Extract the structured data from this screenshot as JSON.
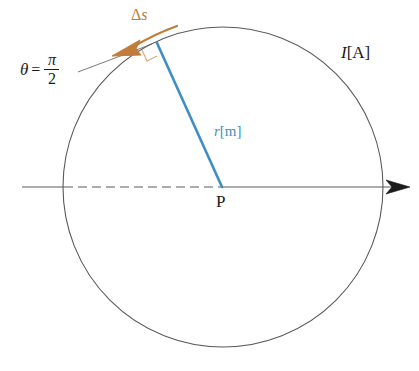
{
  "figure": {
    "width": 419,
    "height": 371,
    "background": "#ffffff"
  },
  "colors": {
    "circle_stroke": "#5a5a5a",
    "axis_stroke": "#5a5a5a",
    "radius_blue": "#3d8ec4",
    "arc_orange": "#c07c38",
    "text_black": "#1a1a1a"
  },
  "geometry": {
    "center": {
      "x": 223,
      "y": 187
    },
    "radius": 160,
    "radius_endpoint": {
      "x": 157,
      "y": 43
    },
    "axis_y": 187,
    "axis_start_x": 22,
    "axis_end_x": 408,
    "arrow_tip_x": 410
  },
  "labels": {
    "theta": {
      "symbol": "θ",
      "equals": "=",
      "numerator": "π",
      "denominator": "2",
      "full_text": "θ = π/2"
    },
    "delta_s": {
      "delta": "Δ",
      "variable": "s",
      "full_text": "Δs"
    },
    "current": {
      "variable": "I",
      "unit": "[A]",
      "full_text": "I[A]"
    },
    "radius": {
      "variable": "r",
      "unit": "[m]",
      "full_text": "r[m]"
    },
    "point_p": {
      "text": "P"
    }
  },
  "elements": {
    "circle_name": "current-loop-circle",
    "axis_name": "horizontal-axis",
    "dashed_segment_name": "dashed-axis-segment",
    "radius_line_name": "radius-line",
    "arc_arrow_name": "delta-s-arrow",
    "right_angle_name": "right-angle-marker",
    "leader_line_name": "theta-leader-line",
    "axis_arrowhead_name": "axis-arrowhead"
  }
}
